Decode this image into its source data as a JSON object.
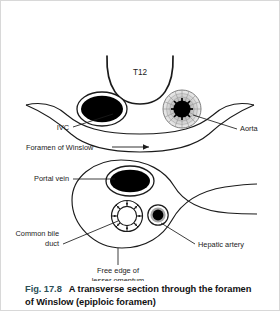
{
  "figure": {
    "caption": {
      "figure_number": "Fig. 17.8",
      "title_line_1": "A transverse section through the foramen",
      "title_line_2": "of Winslow (epiploic foramen)"
    },
    "labels": {
      "vertebra": "T12",
      "ivc": "IVC",
      "aorta": "Aorta",
      "foramen_of_winslow": "Foramen of Winslow",
      "portal_vein": "Portal vein",
      "common_bile_duct_line_1": "Common bile",
      "common_bile_duct_line_2": "duct",
      "hepatic_artery": "Hepatic artery",
      "lesser_omentum_line_1": "Free edge of",
      "lesser_omentum_line_2": "lesser omentum"
    },
    "colors": {
      "stroke": "#1b1b1b",
      "fill_lumen": "#000000",
      "text": "#1b1b1b",
      "caption_figno": "#2d4f57",
      "caption_title": "#111111",
      "background": "#ffffff",
      "border": "#d8d8d8"
    }
  }
}
